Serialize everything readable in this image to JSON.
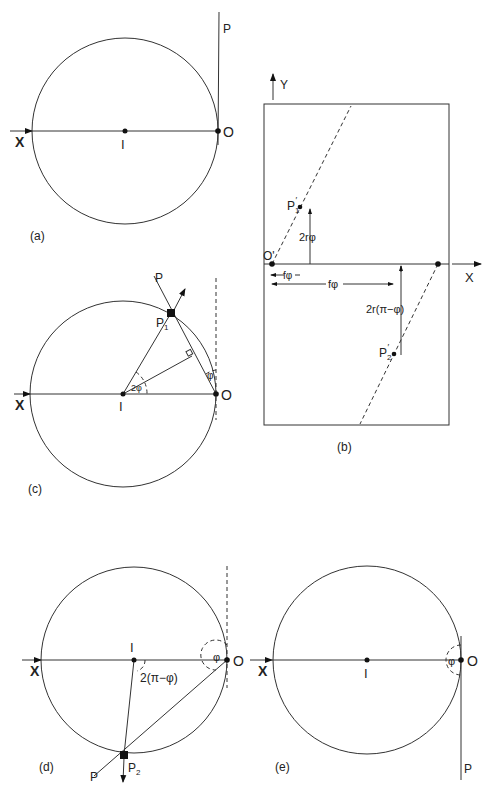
{
  "panels": {
    "a": {
      "caption": "(a)",
      "labels": {
        "x_axis": "X",
        "center": "I",
        "origin": "O",
        "ray": "P"
      }
    },
    "b": {
      "caption": "(b)",
      "labels": {
        "y_axis": "Y",
        "x_axis": "X",
        "origin": "O'",
        "p1": "P1'",
        "p1_sub": "1",
        "p2": "P2'",
        "p2_sub": "2",
        "dim_2rphi": "2rφ",
        "dim_fphi_short": "fφ",
        "dim_fphi_long": "fφ",
        "dim_2r_pi_minus_phi": "2r(π−φ)"
      }
    },
    "c": {
      "caption": "(c)",
      "labels": {
        "x_axis": "X",
        "center": "I",
        "origin": "O",
        "ray": "P",
        "point": "P",
        "point_sub": "1",
        "angle_center": "2φ",
        "angle_origin": "φ"
      }
    },
    "d": {
      "caption": "(d)",
      "labels": {
        "x_axis": "X",
        "center": "I",
        "origin": "O",
        "ray": "P",
        "point": "P",
        "point_sub": "2",
        "angle_center": "2(π−φ)",
        "angle_origin": "φ"
      }
    },
    "e": {
      "caption": "(e)",
      "labels": {
        "x_axis": "X",
        "center": "I",
        "origin": "O",
        "ray": "P",
        "angle_origin": "φ"
      }
    }
  }
}
